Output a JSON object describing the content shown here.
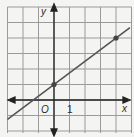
{
  "chart_data": {
    "type": "line",
    "title": "",
    "xlabel": "x",
    "ylabel": "y",
    "origin_label": "O",
    "tick_labels": [
      "1"
    ],
    "xlim": [
      -3,
      5
    ],
    "ylim": [
      -2,
      6
    ],
    "grid": true,
    "series": [
      {
        "name": "line",
        "equation": "y = 0.75x + 1",
        "slope": 0.75,
        "intercept": 1,
        "points": [
          {
            "x": 0,
            "y": 1
          },
          {
            "x": 4,
            "y": 4
          }
        ]
      }
    ]
  },
  "colors": {
    "background": "#f4f4f2",
    "grid": "#9a9a9a",
    "axis": "#222222",
    "line": "#555555",
    "point": "#444444"
  }
}
